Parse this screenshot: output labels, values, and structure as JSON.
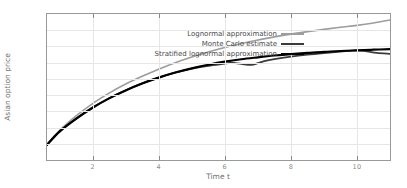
{
  "chart_data": {
    "type": "line",
    "title": "",
    "xlabel": "Time t",
    "ylabel": "Asian option price",
    "xlim": [
      0.62,
      11.0
    ],
    "ylim": [
      0.1,
      1.0
    ],
    "xticks": [
      2,
      4,
      6,
      8,
      10
    ],
    "yticks": [
      0.1,
      0.2,
      0.3,
      0.4,
      0.5,
      0.6,
      0.7,
      0.8,
      0.9,
      1
    ],
    "grid": true,
    "legend_position": "top-left-inside",
    "series": [
      {
        "name": "Lognormal approximation",
        "color": "#9d9d9d",
        "width": 1.6,
        "x": [
          0.62,
          1,
          1.5,
          2,
          2.5,
          3,
          3.5,
          4,
          4.5,
          5,
          5.5,
          6,
          6.5,
          7,
          7.5,
          8,
          8.5,
          9,
          9.5,
          10,
          10.5,
          11
        ],
        "y": [
          0.195,
          0.282,
          0.372,
          0.448,
          0.512,
          0.568,
          0.616,
          0.66,
          0.7,
          0.735,
          0.766,
          0.794,
          0.818,
          0.84,
          0.859,
          0.876,
          0.891,
          0.905,
          0.918,
          0.93,
          0.945,
          0.963
        ]
      },
      {
        "name": "Monte Carlo estimate",
        "color": "#3b3b3b",
        "width": 1.8,
        "x": [
          0.62,
          1,
          1.5,
          2,
          2.5,
          3,
          3.5,
          4,
          4.5,
          5,
          5.5,
          6,
          6.2,
          6.5,
          6.8,
          7.0,
          7.2,
          7.5,
          8,
          8.5,
          9,
          9.5,
          10,
          10.3,
          10.6,
          11
        ],
        "y": [
          0.195,
          0.277,
          0.356,
          0.424,
          0.481,
          0.53,
          0.572,
          0.608,
          0.639,
          0.664,
          0.681,
          0.694,
          0.7,
          0.692,
          0.686,
          0.697,
          0.71,
          0.722,
          0.737,
          0.749,
          0.759,
          0.768,
          0.776,
          0.77,
          0.76,
          0.754
        ]
      },
      {
        "name": "Stratified lognormal approximation",
        "color": "#000000",
        "width": 2.2,
        "x": [
          0.62,
          1,
          1.5,
          2,
          2.5,
          3,
          3.5,
          4,
          4.5,
          5,
          5.5,
          6,
          6.5,
          7,
          7.5,
          8,
          8.5,
          9,
          9.5,
          10,
          10.5,
          11
        ],
        "y": [
          0.193,
          0.275,
          0.354,
          0.422,
          0.48,
          0.529,
          0.572,
          0.608,
          0.639,
          0.665,
          0.687,
          0.706,
          0.721,
          0.733,
          0.744,
          0.753,
          0.76,
          0.767,
          0.772,
          0.776,
          0.78,
          0.783
        ]
      }
    ]
  },
  "axis": {
    "xlabel": "Time t",
    "ylabel": "Asian option price",
    "xtick_labels": [
      "2",
      "4",
      "6",
      "8",
      "10"
    ],
    "ytick_labels": [
      "0.1",
      "0.2",
      "0.3",
      "0.4",
      "0.5",
      "0.6",
      "0.7",
      "0.8",
      "0.9",
      "1"
    ]
  },
  "legend": {
    "items": [
      {
        "label": "Lognormal approximation",
        "color": "#9d9d9d",
        "width": 1.6
      },
      {
        "label": "Monte Carlo estimate",
        "color": "#3b3b3b",
        "width": 2.0
      },
      {
        "label": "Stratified lognormal approximation",
        "color": "#000000",
        "width": 2.6
      }
    ]
  },
  "colors": {
    "frame": "#9a9a9a",
    "grid": "#e6e6e6",
    "tick_text": "#8c8c8c",
    "axis_title": "#6f6f6f",
    "background": "#ffffff"
  }
}
